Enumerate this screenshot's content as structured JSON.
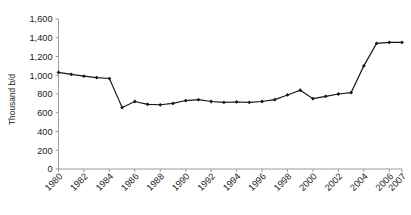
{
  "chart_data": {
    "type": "line",
    "title": "",
    "xlabel": "",
    "ylabel": "Thousand  b/d",
    "ylim": [
      0,
      1600
    ],
    "ytick_labels": [
      "0",
      "200",
      "400",
      "600",
      "800",
      "1,000",
      "1,200",
      "1,400",
      "1,600"
    ],
    "ytick_values": [
      0,
      200,
      400,
      600,
      800,
      1000,
      1200,
      1400,
      1600
    ],
    "xtick_labels": [
      "1980",
      "1982",
      "1984",
      "1986",
      "1988",
      "1990",
      "1992",
      "1994",
      "1996",
      "1998",
      "2000",
      "2002",
      "2004",
      "2006",
      "2007"
    ],
    "xtick_values": [
      1980,
      1982,
      1984,
      1986,
      1988,
      1990,
      1992,
      1994,
      1996,
      1998,
      2000,
      2002,
      2004,
      2006,
      2007
    ],
    "grid": false,
    "legend": false,
    "marker": "diamond",
    "line_color": "#161616",
    "axis_color": "#9a9a9a",
    "x": [
      1980,
      1981,
      1982,
      1983,
      1984,
      1985,
      1986,
      1987,
      1988,
      1989,
      1990,
      1991,
      1992,
      1993,
      1994,
      1995,
      1996,
      1997,
      1998,
      1999,
      2000,
      2001,
      2002,
      2003,
      2004,
      2005,
      2006,
      2007
    ],
    "values": [
      1030,
      1010,
      990,
      975,
      965,
      655,
      720,
      690,
      685,
      700,
      730,
      740,
      720,
      710,
      715,
      710,
      720,
      740,
      790,
      840,
      750,
      775,
      800,
      815,
      1100,
      1340,
      1350,
      1350
    ],
    "series": [
      {
        "name": "Thousand b/d",
        "values": [
          1030,
          1010,
          990,
          975,
          965,
          655,
          720,
          690,
          685,
          700,
          730,
          740,
          720,
          710,
          715,
          710,
          720,
          740,
          790,
          840,
          750,
          775,
          800,
          815,
          1100,
          1340,
          1350,
          1350
        ]
      }
    ]
  }
}
